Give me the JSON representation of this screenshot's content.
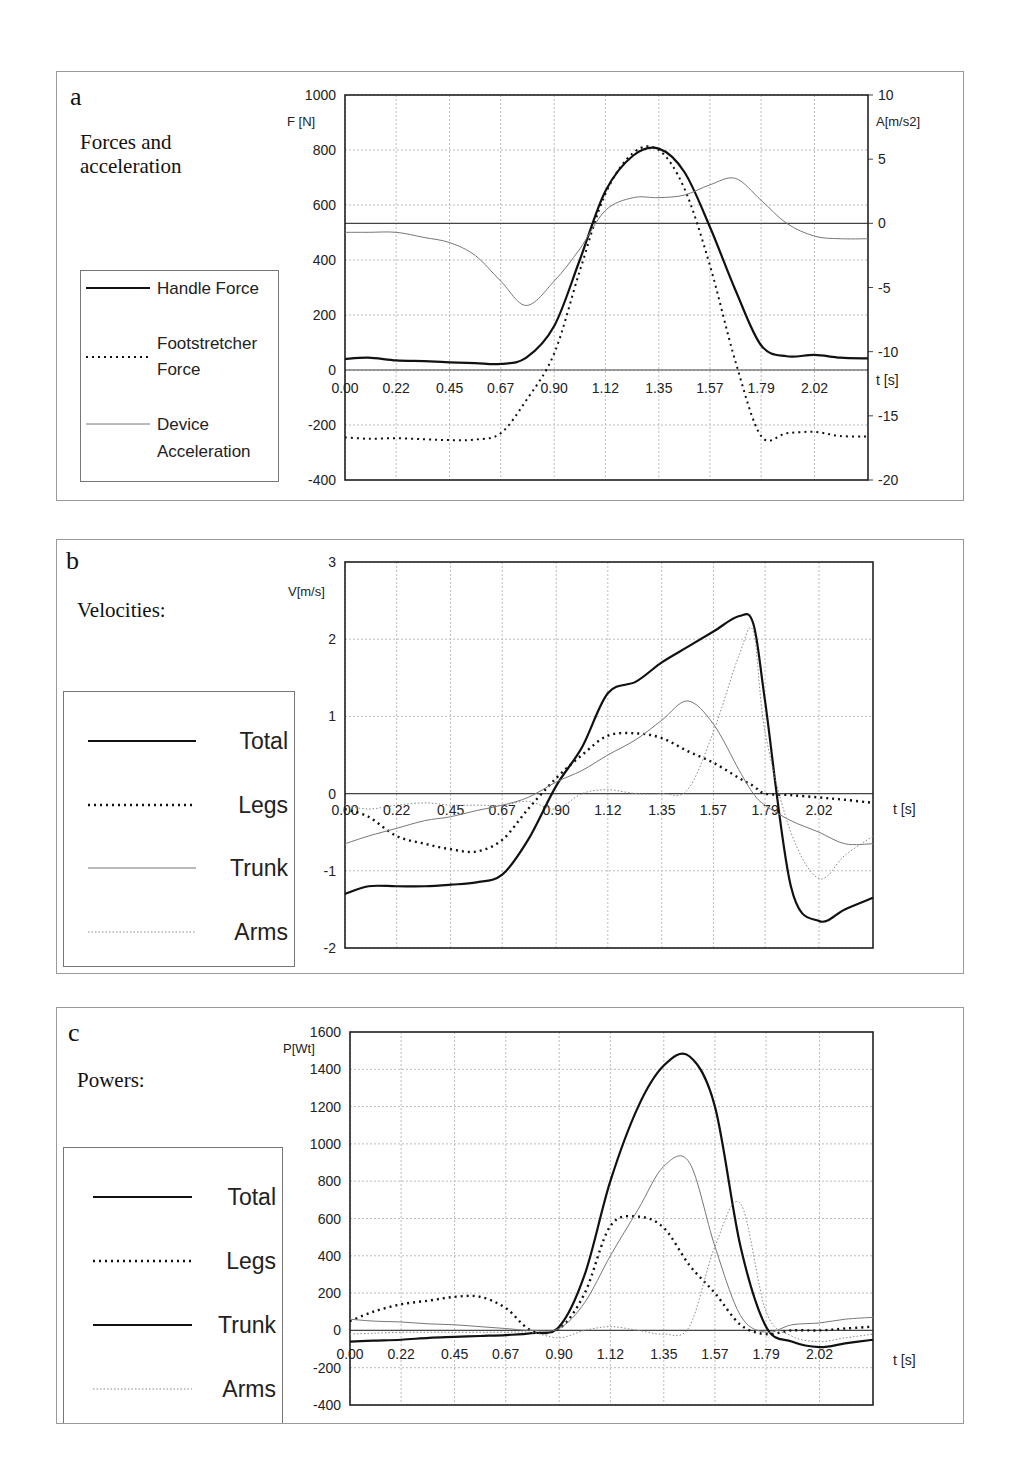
{
  "chart_data": [
    {
      "panel": "a",
      "type": "line",
      "title": "Forces and acceleration",
      "xlabel": "t [s]",
      "ylabel": "F [N]",
      "y2label": "A[m/s2]",
      "ylim": [
        -400,
        1000
      ],
      "y2lim": [
        -20,
        10
      ],
      "yticks": [
        "1000",
        "800",
        "600",
        "400",
        "200",
        "0",
        "-200",
        "-400"
      ],
      "y2ticks": [
        "10",
        "5",
        "0",
        "-5",
        "-10",
        "-15",
        "-20"
      ],
      "xticks": [
        "0.00",
        "0.22",
        "0.45",
        "0.67",
        "0.90",
        "1.12",
        "1.35",
        "1.57",
        "1.79",
        "2.02"
      ],
      "grid": true,
      "legend_position": "left",
      "x": [
        0.0,
        0.1,
        0.22,
        0.34,
        0.45,
        0.56,
        0.67,
        0.78,
        0.9,
        1.01,
        1.12,
        1.24,
        1.35,
        1.46,
        1.57,
        1.68,
        1.79,
        1.9,
        2.02,
        2.13,
        2.25
      ],
      "series": [
        {
          "name": "Handle Force",
          "axis": "left",
          "style": "solid-bold",
          "values": [
            40,
            45,
            35,
            32,
            28,
            25,
            22,
            45,
            160,
            400,
            650,
            780,
            805,
            720,
            520,
            290,
            90,
            50,
            55,
            45,
            42
          ]
        },
        {
          "name": "Footstretcher Force",
          "axis": "left",
          "style": "dotted",
          "values": [
            -245,
            -250,
            -248,
            -252,
            -255,
            -253,
            -230,
            -110,
            60,
            360,
            640,
            790,
            800,
            660,
            380,
            30,
            -240,
            -230,
            -225,
            -240,
            -242
          ]
        },
        {
          "name": "Device Acceleration",
          "axis": "right",
          "style": "thin",
          "values": [
            -0.7,
            -0.7,
            -0.7,
            -1.1,
            -1.5,
            -2.5,
            -4.5,
            -6.4,
            -4.5,
            -2,
            1,
            2,
            2,
            2.2,
            3,
            3.5,
            1.8,
            0,
            -1,
            -1.2,
            -1.2
          ]
        }
      ]
    },
    {
      "panel": "b",
      "type": "line",
      "title": "Velocities:",
      "xlabel": "t [s]",
      "ylabel": "V[m/s]",
      "ylim": [
        -2,
        3
      ],
      "yticks": [
        "3",
        "2",
        "1",
        "0",
        "-1",
        "-2"
      ],
      "xticks": [
        "0.00",
        "0.22",
        "0.45",
        "0.67",
        "0.90",
        "1.12",
        "1.35",
        "1.57",
        "1.79",
        "2.02"
      ],
      "grid": true,
      "legend_position": "left",
      "x": [
        0.0,
        0.1,
        0.22,
        0.34,
        0.45,
        0.56,
        0.67,
        0.78,
        0.9,
        1.01,
        1.12,
        1.24,
        1.35,
        1.46,
        1.57,
        1.68,
        1.74,
        1.79,
        1.9,
        2.02,
        2.13,
        2.25
      ],
      "series": [
        {
          "name": "Total",
          "style": "solid-bold",
          "values": [
            -1.3,
            -1.2,
            -1.2,
            -1.2,
            -1.18,
            -1.15,
            -1.05,
            -0.6,
            0.1,
            0.6,
            1.3,
            1.45,
            1.7,
            1.9,
            2.1,
            2.3,
            2.2,
            1.2,
            -1.2,
            -1.65,
            -1.5,
            -1.35
          ]
        },
        {
          "name": "Legs",
          "style": "dotted-bold",
          "values": [
            -0.2,
            -0.3,
            -0.55,
            -0.65,
            -0.72,
            -0.75,
            -0.6,
            -0.2,
            0.2,
            0.5,
            0.75,
            0.78,
            0.72,
            0.55,
            0.4,
            0.2,
            0.1,
            0.0,
            -0.02,
            -0.05,
            -0.08,
            -0.12
          ]
        },
        {
          "name": "Trunk",
          "style": "thin",
          "values": [
            -0.65,
            -0.55,
            -0.45,
            -0.35,
            -0.3,
            -0.22,
            -0.15,
            -0.05,
            0.15,
            0.3,
            0.5,
            0.7,
            0.95,
            1.2,
            0.9,
            0.3,
            0.0,
            -0.15,
            -0.35,
            -0.5,
            -0.65,
            -0.65
          ]
        },
        {
          "name": "Arms",
          "style": "thin-dotted",
          "values": [
            -0.15,
            -0.2,
            -0.15,
            -0.12,
            -0.15,
            -0.15,
            -0.15,
            -0.1,
            -0.2,
            0.0,
            0.05,
            0.0,
            0.0,
            0.05,
            0.8,
            1.8,
            2.1,
            0.8,
            -0.5,
            -1.1,
            -0.8,
            -0.55
          ]
        }
      ]
    },
    {
      "panel": "c",
      "type": "line",
      "title": "Powers:",
      "xlabel": "t [s]",
      "ylabel": "P[Wt]",
      "ylim": [
        -400,
        1600
      ],
      "yticks": [
        "1600",
        "1400",
        "1200",
        "1000",
        "800",
        "600",
        "400",
        "200",
        "0",
        "-200",
        "-400"
      ],
      "xticks": [
        "0.00",
        "0.22",
        "0.45",
        "0.67",
        "0.90",
        "1.12",
        "1.35",
        "1.57",
        "1.79",
        "2.02"
      ],
      "grid": true,
      "legend_position": "left",
      "x": [
        0.0,
        0.1,
        0.22,
        0.34,
        0.45,
        0.56,
        0.67,
        0.78,
        0.9,
        1.01,
        1.12,
        1.24,
        1.35,
        1.46,
        1.57,
        1.68,
        1.79,
        1.9,
        2.02,
        2.13,
        2.25
      ],
      "series": [
        {
          "name": "Total",
          "style": "solid-bold",
          "values": [
            -60,
            -55,
            -50,
            -40,
            -35,
            -30,
            -25,
            -15,
            20,
            300,
            800,
            1200,
            1420,
            1470,
            1200,
            450,
            20,
            -60,
            -90,
            -70,
            -50
          ]
        },
        {
          "name": "Legs",
          "style": "dotted-bold",
          "values": [
            50,
            100,
            140,
            160,
            180,
            180,
            120,
            0,
            10,
            200,
            560,
            610,
            550,
            350,
            200,
            30,
            -20,
            0,
            0,
            10,
            20
          ]
        },
        {
          "name": "Trunk",
          "style": "thin",
          "values": [
            60,
            50,
            45,
            35,
            30,
            20,
            10,
            0,
            10,
            150,
            400,
            650,
            880,
            900,
            450,
            80,
            -10,
            30,
            40,
            60,
            70
          ]
        },
        {
          "name": "Arms",
          "style": "thin-dotted",
          "values": [
            -20,
            -15,
            -10,
            -10,
            -10,
            -10,
            -10,
            -10,
            -40,
            0,
            20,
            0,
            -20,
            20,
            450,
            680,
            100,
            -30,
            -60,
            -40,
            -20
          ]
        }
      ]
    }
  ],
  "panels": {
    "a": {
      "letter": "a",
      "title_line1": "Forces and",
      "title_line2": "acceleration",
      "ylabel": "F [N]",
      "y2label": "A[m/s2]",
      "xlabel": "t [s]",
      "legend": [
        "Handle Force",
        "Footstretcher",
        "Force",
        "Device",
        "Acceleration"
      ]
    },
    "b": {
      "letter": "b",
      "title": "Velocities:",
      "ylabel": "V[m/s]",
      "xlabel": "t [s]",
      "legend": [
        "Total",
        "Legs",
        "Trunk",
        "Arms"
      ]
    },
    "c": {
      "letter": "c",
      "title": "Powers:",
      "ylabel": "P[Wt]",
      "xlabel": "t [s]",
      "legend": [
        "Total",
        "Legs",
        "Trunk",
        "Arms"
      ]
    }
  },
  "colors": {
    "line": "#111111",
    "thin": "#666666",
    "grid": "#bbbbbb",
    "frame": "#9a9a9a"
  }
}
